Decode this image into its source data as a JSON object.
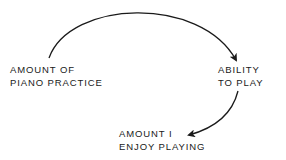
{
  "diagram": {
    "nodes": [
      {
        "id": "practice",
        "line1": "AMOUNT OF",
        "line2": "PIANO PRACTICE"
      },
      {
        "id": "ability",
        "line1": "ABILITY",
        "line2": "TO PLAY"
      },
      {
        "id": "enjoy",
        "line1": "AMOUNT I",
        "line2": "ENJOY PLAYING"
      }
    ],
    "edges": [
      {
        "from": "practice",
        "to": "ability"
      },
      {
        "from": "ability",
        "to": "enjoy"
      }
    ],
    "colors": {
      "ink": "#1a1a1a",
      "background": "#ffffff"
    }
  }
}
